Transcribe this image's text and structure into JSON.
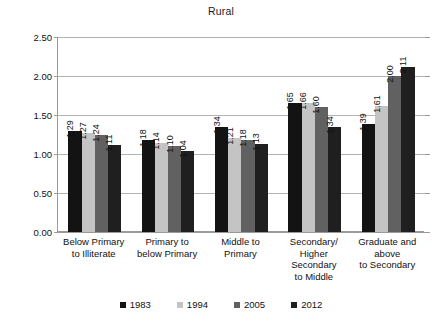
{
  "chart_data": {
    "type": "bar",
    "title": "Rural",
    "xlabel": "",
    "ylabel": "",
    "ylim": [
      0.0,
      2.5
    ],
    "ytick_labels": [
      "0.00",
      "0.50",
      "1.00",
      "1.50",
      "2.00",
      "2.50"
    ],
    "ytick_values": [
      0.0,
      0.5,
      1.0,
      1.5,
      2.0,
      2.5
    ],
    "grid": true,
    "legend_position": "bottom",
    "categories": [
      "Below Primary\nto Illiterate",
      "Primary to\nbelow Primary",
      "Middle to\nPrimary",
      "Secondary/\nHigher\nSecondary\nto Middle",
      "Graduate and\nabove\nto Secondary"
    ],
    "series": [
      {
        "name": "1983",
        "color": "#131313",
        "values": [
          1.29,
          1.18,
          1.34,
          1.65,
          1.39
        ]
      },
      {
        "name": "1994",
        "color": "#c4c4c4",
        "values": [
          1.27,
          1.14,
          1.21,
          1.66,
          1.61
        ]
      },
      {
        "name": "2005",
        "color": "#616161",
        "values": [
          1.24,
          1.1,
          1.18,
          1.6,
          2.0
        ]
      },
      {
        "name": "2012",
        "color": "#1f1f1f",
        "values": [
          1.11,
          1.04,
          1.13,
          1.34,
          2.11
        ]
      }
    ],
    "data_labels": [
      [
        "1.29",
        "1.27",
        "1.24",
        "1.11"
      ],
      [
        "1.18",
        "1.14",
        "1.10",
        "1.04"
      ],
      [
        "1.34",
        "1.21",
        "1.18",
        "1.13"
      ],
      [
        "1.65",
        "1.66",
        "1.60",
        "1.34"
      ],
      [
        "1.39",
        "1.61",
        "2.00",
        "2.11"
      ]
    ]
  }
}
